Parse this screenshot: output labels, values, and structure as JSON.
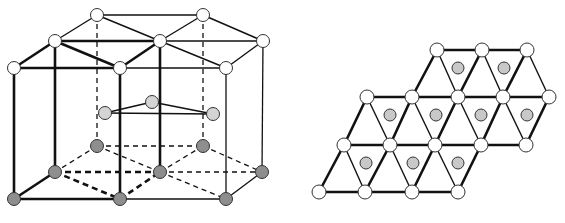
{
  "colors": {
    "line": "#111111",
    "node_open": "#ffffff",
    "node_mid": "#d4d4d4",
    "node_base": "#8e8e8e",
    "node_center": "#c8c8c8",
    "node_stroke": "#333333"
  },
  "hex_cell": {
    "top_nodes": [
      [
        97,
        15
      ],
      [
        203,
        15
      ],
      [
        55,
        41
      ],
      [
        160,
        41
      ],
      [
        263,
        41
      ],
      [
        14,
        68
      ],
      [
        120,
        68
      ],
      [
        226,
        68
      ]
    ],
    "mid_nodes": [
      [
        105,
        113
      ],
      [
        152,
        102
      ],
      [
        213,
        114
      ]
    ],
    "base_nodes": [
      [
        97,
        146
      ],
      [
        203,
        146
      ],
      [
        55,
        172
      ],
      [
        160,
        172
      ],
      [
        262,
        172
      ],
      [
        14,
        199
      ],
      [
        120,
        199
      ],
      [
        226,
        199
      ]
    ],
    "top_edges_thick": [
      [
        1,
        0,
        4,
        6
      ],
      [
        2,
        5
      ],
      [
        2,
        6
      ],
      [
        3,
        6
      ],
      [
        2,
        3
      ],
      [
        5,
        6
      ]
    ],
    "top_edges": [
      [
        0,
        1
      ],
      [
        0,
        2
      ],
      [
        0,
        3
      ],
      [
        1,
        3
      ],
      [
        1,
        4
      ],
      [
        3,
        4
      ],
      [
        3,
        7
      ],
      [
        4,
        7
      ],
      [
        6,
        7
      ],
      [
        2,
        3
      ]
    ],
    "verticals_solid_thick": [
      [
        5,
        5
      ],
      [
        2,
        2
      ],
      [
        6,
        6
      ],
      [
        3,
        3
      ]
    ],
    "verticals_solid": [
      [
        4,
        4
      ],
      [
        7,
        7
      ]
    ],
    "verticals_dashed": [
      [
        0,
        0
      ],
      [
        1,
        1
      ]
    ],
    "mid_edges": [
      [
        0,
        1
      ],
      [
        1,
        2
      ],
      [
        0,
        2
      ]
    ],
    "base_edges_solid_thick": [
      [
        5,
        2
      ],
      [
        5,
        6
      ]
    ],
    "base_edges_solid": [
      [
        6,
        7
      ],
      [
        7,
        4
      ]
    ],
    "base_edges_dashed_thick": [
      [
        2,
        3
      ],
      [
        2,
        6
      ],
      [
        6,
        3
      ]
    ],
    "base_edges_dashed": [
      [
        0,
        1
      ],
      [
        0,
        2
      ],
      [
        0,
        3
      ],
      [
        1,
        3
      ],
      [
        1,
        4
      ],
      [
        3,
        4
      ],
      [
        3,
        7
      ]
    ]
  },
  "lattice": {
    "rows": [
      {
        "y": 50,
        "x": [
          437,
          482,
          527
        ]
      },
      {
        "y": 97,
        "x": [
          367,
          412,
          458,
          503,
          549
        ]
      },
      {
        "y": 145,
        "x": [
          344,
          390,
          435,
          481,
          526
        ]
      },
      {
        "y": 192,
        "x": [
          319,
          365,
          412,
          458
        ]
      }
    ],
    "centers": [
      [
        458,
        68
      ],
      [
        504,
        68
      ],
      [
        390,
        115
      ],
      [
        436,
        115
      ],
      [
        481,
        115
      ],
      [
        527,
        115
      ],
      [
        366,
        163
      ],
      [
        413,
        163
      ],
      [
        458,
        163
      ]
    ]
  }
}
